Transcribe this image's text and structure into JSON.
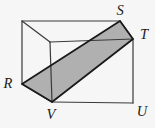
{
  "figure": {
    "type": "geometry-diagram",
    "vertex_labels": [
      {
        "text": "S",
        "x": 120,
        "y": 10
      },
      {
        "text": "T",
        "x": 144,
        "y": 34
      },
      {
        "text": "R",
        "x": 8,
        "y": 83
      },
      {
        "text": "V",
        "x": 51,
        "y": 114
      },
      {
        "text": "U",
        "x": 142,
        "y": 111
      }
    ],
    "points": {
      "back_top_left": [
        22,
        21
      ],
      "S": [
        120,
        21
      ],
      "T": [
        133,
        39
      ],
      "U": [
        133,
        103
      ],
      "V": [
        52,
        102
      ],
      "R": [
        22,
        84
      ],
      "front_top_left": [
        50,
        42
      ]
    },
    "box_edges": [
      [
        "back_top_left",
        "S"
      ],
      [
        "back_top_left",
        "R"
      ],
      [
        "back_top_left",
        "front_top_left"
      ],
      [
        "front_top_left",
        "T"
      ],
      [
        "front_top_left",
        "V"
      ],
      [
        "S",
        "T"
      ],
      [
        "T",
        "U"
      ],
      [
        "U",
        "V"
      ],
      [
        "V",
        "R"
      ]
    ],
    "shaded_section": [
      "R",
      "V",
      "T",
      "S"
    ],
    "colors": {
      "background": "#f6f6f6",
      "edge": "#3a3a3a",
      "section_fill": "#b0b0b0",
      "section_outline": "#1a1a1a",
      "label": "#1a1a1a"
    },
    "stroke_widths": {
      "edge": 1.2,
      "section_outline": 1.8
    }
  }
}
